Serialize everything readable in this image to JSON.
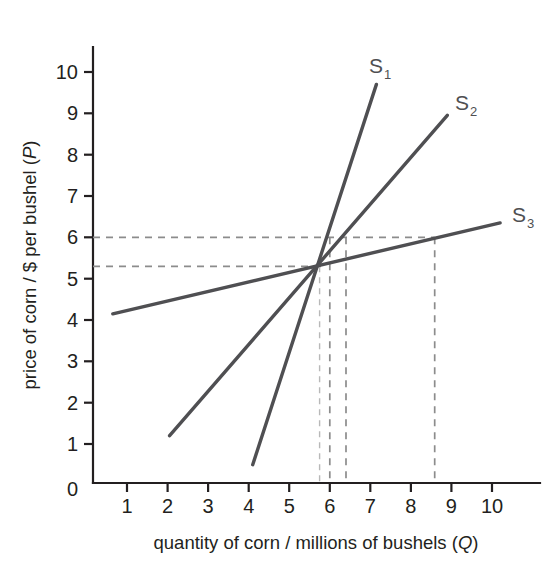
{
  "chart_data": {
    "type": "line",
    "title": "",
    "xlabel": "quantity of corn / millions of bushels (Q)",
    "ylabel": "price of corn / $ per bushel (P)",
    "xlabel_parts": {
      "text": "quantity of corn / millions of bushels (",
      "var": "Q",
      "close": ")"
    },
    "ylabel_parts": {
      "text": "price of corn / $ per bushel (",
      "var": "P",
      "close": ")"
    },
    "xlim": [
      0,
      10.7
    ],
    "ylim": [
      0,
      10.7
    ],
    "xticks": [
      1,
      2,
      3,
      4,
      5,
      6,
      7,
      8,
      9,
      10
    ],
    "yticks": [
      1,
      2,
      3,
      4,
      5,
      6,
      7,
      8,
      9,
      10
    ],
    "origin_label": "0",
    "grid": false,
    "legend": "inline-end-labels",
    "series": [
      {
        "name": "S1",
        "label_base": "S",
        "label_sub": "1",
        "color": "#4f4f52",
        "points": [
          [
            4.1,
            0.5
          ],
          [
            7.15,
            9.7
          ]
        ],
        "slope_note": "steepest supply curve (most inelastic)"
      },
      {
        "name": "S2",
        "label_base": "S",
        "label_sub": "2",
        "color": "#4f4f52",
        "points": [
          [
            2.05,
            1.2
          ],
          [
            8.9,
            8.95
          ]
        ],
        "slope_note": "intermediate slope supply curve"
      },
      {
        "name": "S3",
        "label_base": "S",
        "label_sub": "3",
        "color": "#4f4f52",
        "points": [
          [
            0.65,
            4.15
          ],
          [
            10.2,
            6.35
          ]
        ],
        "slope_note": "flattest supply curve (most elastic)"
      }
    ],
    "intersection": {
      "q": 5.75,
      "p": 5.3
    },
    "guides": {
      "horizontal": [
        {
          "p": 6.0,
          "from_q": 0,
          "to_q": 8.5,
          "style": "dashed"
        },
        {
          "p": 5.3,
          "from_q": 0,
          "to_q": 5.75,
          "style": "dashed"
        }
      ],
      "vertical": [
        {
          "q": 5.75,
          "from_p": 0,
          "to_p": 5.3,
          "style": "dashed-light"
        },
        {
          "q": 6.0,
          "from_p": 0,
          "to_p": 6.0,
          "style": "dashed"
        },
        {
          "q": 6.4,
          "from_p": 0,
          "to_p": 6.0,
          "style": "dashed"
        },
        {
          "q": 8.5,
          "from_p": 0,
          "to_p": 6.0,
          "style": "dashed"
        }
      ]
    },
    "annotations": [
      {
        "text": "S1 quantity response to price rise 5.3 -> 6.0 is smallest (Q ~ 6.0)"
      },
      {
        "text": "S2 quantity response is intermediate (Q ~ 6.4)"
      },
      {
        "text": "S3 quantity response is largest (Q ~ 8.5)"
      }
    ]
  }
}
